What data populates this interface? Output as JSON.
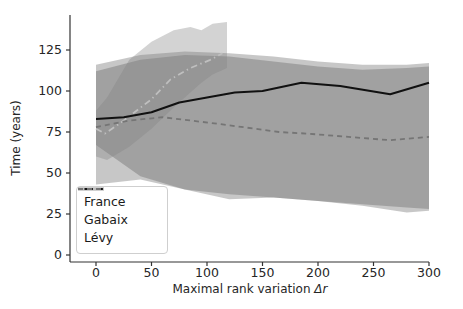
{
  "figure": {
    "background": "#ffffff",
    "text_color": "#262626",
    "spine_color": "#333333"
  },
  "chart_data": {
    "type": "line",
    "title": "",
    "xlabel": "Maximal rank variation Δr",
    "xlabel_prefix": "Maximal rank variation ",
    "xlabel_symbol": "Δr",
    "ylabel": "Time (years)",
    "xlim": [
      -23,
      300
    ],
    "ylim": [
      -4,
      146
    ],
    "xticks": [
      0,
      50,
      100,
      150,
      200,
      250,
      300
    ],
    "yticks": [
      0,
      25,
      50,
      75,
      100,
      125
    ],
    "grid": false,
    "legend_position": "lower-left",
    "series": [
      {
        "name": "France",
        "style": "solid",
        "color": "#111111",
        "width": 2,
        "x": [
          0,
          25,
          50,
          75,
          100,
          125,
          150,
          185,
          220,
          265,
          300
        ],
        "y": [
          83,
          84,
          87,
          93,
          96,
          99,
          100,
          105,
          103,
          98,
          105
        ]
      },
      {
        "name": "Gabaix",
        "style": "dashdot",
        "color": "#bfbfbf",
        "width": 1.8,
        "x": [
          0,
          8,
          25,
          50,
          67,
          85,
          103,
          114
        ],
        "y": [
          77,
          74,
          82,
          95,
          107,
          114,
          119,
          123
        ]
      },
      {
        "name": "Lévy",
        "style": "dashed",
        "color": "#757575",
        "width": 1.8,
        "x": [
          0,
          30,
          60,
          110,
          165,
          190,
          265,
          300
        ],
        "y": [
          78,
          82,
          84,
          80,
          75,
          74,
          70,
          72
        ]
      }
    ],
    "bands": [
      {
        "series": "France",
        "color": "#555555",
        "opacity": 0.33,
        "x": [
          0,
          40,
          80,
          120,
          160,
          200,
          240,
          280,
          300
        ],
        "upper": [
          116,
          122,
          124,
          123,
          121,
          118,
          116,
          116,
          117
        ],
        "lower": [
          43,
          46,
          40,
          34,
          35,
          33,
          30,
          26,
          27
        ]
      },
      {
        "series": "Lévy",
        "color": "#555555",
        "opacity": 0.33,
        "x": [
          0,
          40,
          80,
          120,
          160,
          200,
          240,
          280,
          300
        ],
        "upper": [
          112,
          119,
          122,
          121,
          118,
          115,
          113,
          114,
          115
        ],
        "lower": [
          67,
          48,
          40,
          37,
          35,
          33,
          31,
          29,
          28
        ]
      },
      {
        "series": "Gabaix",
        "color": "#808080",
        "opacity": 0.35,
        "x": [
          0,
          10,
          30,
          50,
          70,
          85,
          95,
          105,
          118
        ],
        "upper": [
          88,
          96,
          119,
          130,
          137,
          139,
          137,
          141,
          142
        ],
        "lower": [
          60,
          58,
          66,
          77,
          90,
          99,
          105,
          110,
          114
        ]
      }
    ]
  },
  "legend": {
    "items": [
      {
        "label": "France"
      },
      {
        "label": "Gabaix"
      },
      {
        "label": "Lévy"
      }
    ]
  }
}
